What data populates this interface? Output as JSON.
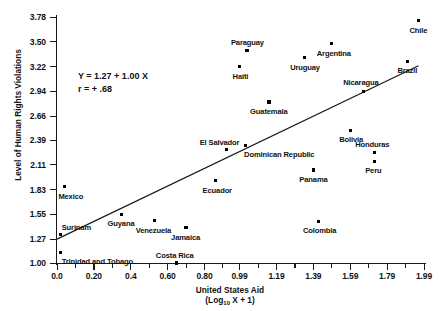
{
  "chart_data": {
    "type": "scatter",
    "title": "",
    "xlabel": "United States Aid (Log10 X + 1)",
    "ylabel": "Level of Human Rights Violations",
    "xlim": [
      0.0,
      2.09
    ],
    "ylim": [
      0.865,
      3.78
    ],
    "grid": false,
    "legend": null,
    "annotations": {
      "equation": "Y = 1.27 + 1.00 X",
      "correlation": "r = + .68"
    },
    "regression": {
      "intercept": 1.27,
      "slope": 1.0,
      "x_start": 0.0,
      "x_end": 1.96
    },
    "xticks": [
      "0.0",
      "0.20",
      "0.4",
      "0.60",
      "0.80",
      "0.99",
      "1.19",
      "1.39",
      "1.59",
      "1.79",
      "1.99"
    ],
    "xtick_values": [
      0.0,
      0.2,
      0.4,
      0.6,
      0.8,
      0.99,
      1.19,
      1.39,
      1.59,
      1.79,
      1.99
    ],
    "yticks": [
      "1.00",
      "1.27",
      "1.55",
      "1.83",
      "2.11",
      "2.39",
      "2.66",
      "2.94",
      "3.22",
      "3.50",
      "3.78"
    ],
    "ytick_values": [
      1.0,
      1.27,
      1.55,
      1.83,
      2.11,
      2.39,
      2.66,
      2.94,
      3.22,
      3.5,
      3.78
    ],
    "points": [
      {
        "label": "Chile",
        "x": 1.96,
        "y": 3.74,
        "lx": -9,
        "ly": 6
      },
      {
        "label": "Argentina",
        "x": 1.49,
        "y": 3.48,
        "lx": -15,
        "ly": 6
      },
      {
        "label": "Paraguay",
        "x": 1.03,
        "y": 3.4,
        "lx": -16,
        "ly": -12
      },
      {
        "label": "Uruguay",
        "x": 1.34,
        "y": 3.32,
        "lx": -14,
        "ly": 6
      },
      {
        "label": "Haiti",
        "x": 0.99,
        "y": 3.22,
        "lx": -7,
        "ly": 6
      },
      {
        "label": "Brazil",
        "x": 1.9,
        "y": 3.28,
        "lx": -10,
        "ly": 6
      },
      {
        "label": "Nicaragua",
        "x": 1.66,
        "y": 2.94,
        "lx": -20,
        "ly": -12
      },
      {
        "label": "Guatemala",
        "x": 1.15,
        "y": 2.82,
        "lx": -19,
        "ly": 6
      },
      {
        "label": "Bolivia",
        "x": 1.59,
        "y": 2.5,
        "lx": -11,
        "ly": 6
      },
      {
        "label": "Dominican Republic",
        "x": 1.02,
        "y": 2.33,
        "lx": -1,
        "ly": 6
      },
      {
        "label": "El Salvador",
        "x": 0.92,
        "y": 2.28,
        "lx": -27,
        "ly": -11
      },
      {
        "label": "Honduras",
        "x": 1.72,
        "y": 2.25,
        "lx": -19,
        "ly": -11
      },
      {
        "label": "Peru",
        "x": 1.72,
        "y": 2.15,
        "lx": -9,
        "ly": 6
      },
      {
        "label": "Panama",
        "x": 1.39,
        "y": 2.05,
        "lx": -14,
        "ly": 6
      },
      {
        "label": "Ecuador",
        "x": 0.86,
        "y": 1.93,
        "lx": -13,
        "ly": 6
      },
      {
        "label": "Mexico",
        "x": 0.04,
        "y": 1.86,
        "lx": -6,
        "ly": 6
      },
      {
        "label": "Colombia",
        "x": 1.42,
        "y": 1.47,
        "lx": -16,
        "ly": 6
      },
      {
        "label": "Guyana",
        "x": 0.35,
        "y": 1.55,
        "lx": -14,
        "ly": 6
      },
      {
        "label": "Venezuela",
        "x": 0.53,
        "y": 1.48,
        "lx": -19,
        "ly": 6
      },
      {
        "label": "Jamaica",
        "x": 0.7,
        "y": 1.4,
        "lx": -15,
        "ly": 6
      },
      {
        "label": "Surinam",
        "x": 0.02,
        "y": 1.32,
        "lx": 1,
        "ly": -11
      },
      {
        "label": "Trinidad and Tobago",
        "x": 0.02,
        "y": 1.12,
        "lx": 1,
        "ly": 6
      },
      {
        "label": "Costa Rica",
        "x": 0.65,
        "y": 1.0,
        "lx": -21,
        "ly": -11
      }
    ]
  }
}
